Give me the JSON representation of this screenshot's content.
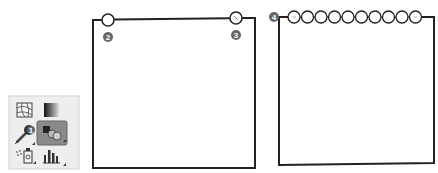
{
  "tool_panel": {
    "tools": [
      {
        "name": "mesh-tool",
        "label": "Mesh"
      },
      {
        "name": "gradient-tool",
        "label": "Gradient"
      },
      {
        "name": "eyedropper-tool",
        "label": "Eyedropper",
        "badge": "1"
      },
      {
        "name": "blend-tool",
        "label": "Blend",
        "selected": true
      },
      {
        "name": "symbol-sprayer-tool",
        "label": "Symbol Sprayer"
      },
      {
        "name": "column-graph-tool",
        "label": "Column Graph"
      }
    ],
    "selected_color": "#8a8a8a"
  },
  "callouts": {
    "one": "1",
    "two": "2",
    "three": "3",
    "four": "4"
  },
  "panels": {
    "left": {
      "description": "Blend between two circles (2 and 3)",
      "circle_count": 2
    },
    "right": {
      "description": "Blended circles from step 4",
      "circle_count": 10
    }
  },
  "colors": {
    "stroke": "#222222",
    "badge": "#666666",
    "panel_bg": "#eeeeee"
  }
}
